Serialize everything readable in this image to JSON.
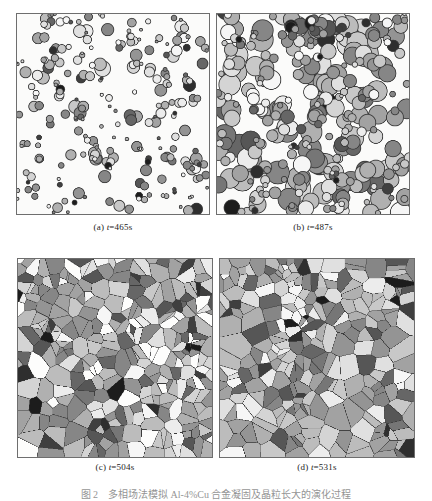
{
  "figure": {
    "caption_number": "图 2",
    "caption_text": "多相场法模拟 Al-4%Cu 合金凝固及晶粒长大的演化过程",
    "panel_count": 4,
    "layout": "2x2 grid"
  },
  "panels": [
    {
      "id": "a",
      "label": "(a)",
      "time_symbol": "t",
      "time_value": "=465s",
      "caption": "(a) t=465s",
      "stage": "early nucleation - sparse isolated circular grains on white matrix",
      "grain_count": 185,
      "shape": "circle",
      "mean_radius_px": 4.0,
      "fill_fraction": 0.1
    },
    {
      "id": "b",
      "label": "(b)",
      "time_symbol": "t",
      "time_value": "=487s",
      "caption": "(b) t=487s",
      "stage": "growth and impingement - larger overlapping circular grains",
      "grain_count": 240,
      "shape": "circle",
      "mean_radius_px": 7.5,
      "fill_fraction": 0.58
    },
    {
      "id": "c",
      "label": "(c)",
      "time_symbol": "t",
      "time_value": "=504s",
      "caption": "(c) t=504s",
      "stage": "dense polygonal grains with residual white liquid pockets",
      "grain_count": 300,
      "shape": "polygon",
      "mean_radius_px": 8.0,
      "fill_fraction": 0.88
    },
    {
      "id": "d",
      "label": "(d)",
      "time_symbol": "t",
      "time_value": "=531s",
      "caption": "(d) t=531s",
      "stage": "fully impinged polycrystalline microstructure",
      "grain_count": 260,
      "shape": "polygon",
      "mean_radius_px": 9.5,
      "fill_fraction": 1.0
    }
  ],
  "style": {
    "background": "#ffffff",
    "panel_background": "#fbfbfa",
    "panel_border": "#6e6e6e",
    "grain_outline": "#3c3c3c",
    "caption_color": "#1c1c1c",
    "gray_palette": [
      "#1c1c1c",
      "#2e2e2e",
      "#3f3f3f",
      "#565656",
      "#666666",
      "#767676",
      "#868686",
      "#949494",
      "#a2a2a2",
      "#b0b0b0",
      "#bcbcbc",
      "#c8c8c8",
      "#d4d4d4",
      "#e0e0e0",
      "#ececec",
      "#f6f6f6"
    ]
  }
}
